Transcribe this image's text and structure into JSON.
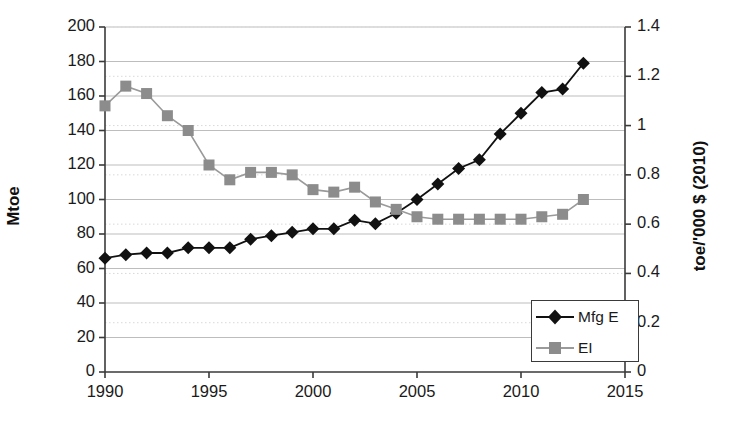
{
  "chart_data": {
    "type": "line",
    "title": "",
    "xlabel": "",
    "ylabel": "Mtoe",
    "ylabel_right": "toe/'000 $ (2010)",
    "x": [
      1990,
      1991,
      1992,
      1993,
      1994,
      1995,
      1996,
      1997,
      1998,
      1999,
      2000,
      2001,
      2002,
      2003,
      2004,
      2005,
      2006,
      2007,
      2008,
      2009,
      2010,
      2011,
      2012,
      2013
    ],
    "xlim": [
      1990,
      2015
    ],
    "ylim": [
      0,
      200
    ],
    "ylim_right": [
      0,
      1.4
    ],
    "xticks": [
      "1990",
      "1995",
      "2000",
      "2005",
      "2010",
      "2015"
    ],
    "xtick_values": [
      1990,
      1995,
      2000,
      2005,
      2010,
      2015
    ],
    "yticks": [
      "0",
      "20",
      "40",
      "60",
      "80",
      "100",
      "120",
      "140",
      "160",
      "180",
      "200"
    ],
    "ytick_values": [
      0,
      20,
      40,
      60,
      80,
      100,
      120,
      140,
      160,
      180,
      200
    ],
    "yticks_right": [
      "0",
      "0.2",
      "0.4",
      "0.6",
      "0.8",
      "1",
      "1.2",
      "1.4"
    ],
    "ytick_right_values": [
      0,
      0.2,
      0.4,
      0.6,
      0.8,
      1.0,
      1.2,
      1.4
    ],
    "grid": true,
    "legend_position": "lower right",
    "series": [
      {
        "name": "Mfg E",
        "axis": "left",
        "marker": "diamond",
        "color": "#111111",
        "values": [
          66,
          68,
          69,
          69,
          72,
          72,
          72,
          77,
          79,
          81,
          83,
          83,
          88,
          86,
          92,
          100,
          109,
          118,
          123,
          138,
          150,
          162,
          164,
          179
        ]
      },
      {
        "name": "EI",
        "axis": "right",
        "marker": "square",
        "color": "#8c8c8c",
        "values": [
          1.08,
          1.16,
          1.13,
          1.04,
          0.98,
          0.84,
          0.78,
          0.81,
          0.81,
          0.8,
          0.74,
          0.73,
          0.75,
          0.69,
          0.66,
          0.63,
          0.62,
          0.62,
          0.62,
          0.62,
          0.62,
          0.63,
          0.64,
          0.7
        ]
      }
    ]
  },
  "legend": {
    "items": [
      {
        "label": "Mfg E",
        "marker": "diamond"
      },
      {
        "label": "EI",
        "marker": "square"
      }
    ]
  },
  "colors": {
    "series_mfg_e": "#111111",
    "series_ei": "#8c8c8c",
    "axis": "#3a3a3a",
    "gridline_major": "#bdbdbd",
    "gridline_minor": "#d9d9d9",
    "background": "#ffffff"
  }
}
